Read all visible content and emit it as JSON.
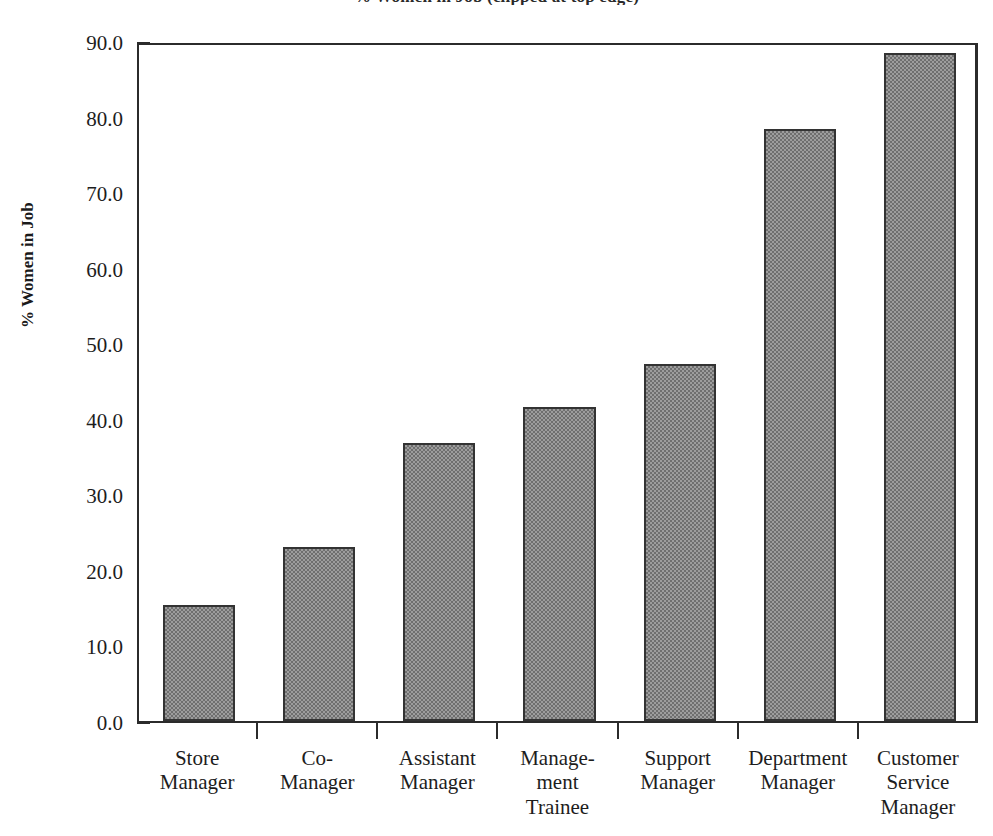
{
  "chart_data": {
    "type": "bar",
    "title": "% Women in Job (clipped at top edge)",
    "xlabel": "",
    "ylabel": "% Women in Job",
    "ylim": [
      0.0,
      90.0
    ],
    "ytick_step": 10.0,
    "yminor_step": 5.0,
    "grid": false,
    "legend": null,
    "categories": [
      "Store Manager",
      "Co-Manager",
      "Assistant Manager",
      "Management Trainee",
      "Support Manager",
      "Department Manager",
      "Customer Service Manager"
    ],
    "category_lines": [
      [
        "Store",
        "Manager"
      ],
      [
        "Co-",
        "Manager"
      ],
      [
        "Assistant",
        "Manager"
      ],
      [
        "Manage-",
        "ment",
        "Trainee"
      ],
      [
        "Support",
        "Manager"
      ],
      [
        "Department",
        "Manager"
      ],
      [
        "Customer",
        "Service",
        "Manager"
      ]
    ],
    "values": [
      15.4,
      23.0,
      36.8,
      41.6,
      47.3,
      78.3,
      88.4
    ],
    "ytick_labels": [
      "0.0",
      "10.0",
      "20.0",
      "30.0",
      "40.0",
      "50.0",
      "60.0",
      "70.0",
      "80.0",
      "90.0"
    ],
    "bar_fill_color": "#9d9d9d",
    "bar_edge_color": "#333333",
    "axis_color": "#2b2b2b",
    "background_color": "#ffffff"
  }
}
